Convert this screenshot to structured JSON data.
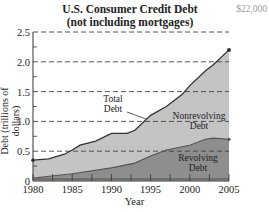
{
  "chart_data": {
    "type": "area",
    "title": "U.S. Consumer Credit Debt",
    "subtitle": "(not including mortgages)",
    "corner_text": "$22,000",
    "xlabel": "Year",
    "ylabel": "Debt (trillions of dollars)",
    "xlim": [
      1980,
      2005
    ],
    "ylim": [
      0,
      2.5
    ],
    "x_ticks": [
      1980,
      1985,
      1990,
      1995,
      2000,
      2005
    ],
    "y_ticks": [
      "0",
      "0.5",
      "1.0",
      "1.5",
      "2.0",
      "2.5"
    ],
    "grid": "horizontal dashed",
    "series": [
      {
        "name": "Total Debt",
        "x": [
          1980,
          1982,
          1984,
          1985,
          1986,
          1988,
          1990,
          1992,
          1993,
          1995,
          1997,
          1999,
          2000,
          2002,
          2003,
          2005
        ],
        "values": [
          0.35,
          0.37,
          0.45,
          0.52,
          0.6,
          0.67,
          0.8,
          0.8,
          0.85,
          1.1,
          1.25,
          1.45,
          1.6,
          1.85,
          1.95,
          2.2
        ]
      },
      {
        "name": "Revolving Debt",
        "x": [
          1980,
          1985,
          1990,
          1993,
          1995,
          1997,
          2000,
          2002,
          2003,
          2005
        ],
        "values": [
          0.05,
          0.12,
          0.22,
          0.3,
          0.42,
          0.52,
          0.6,
          0.7,
          0.72,
          0.7
        ]
      }
    ],
    "area_labels": {
      "total": "Total\nDebt",
      "nonrevolving": "Nonrevolving\nDebt",
      "revolving": "Revolving\nDebt"
    },
    "colors": {
      "nonrevolving_fill": "#c4c4c4",
      "revolving_fill": "#8e8e8e",
      "line": "#333333",
      "grid": "#444444"
    }
  }
}
